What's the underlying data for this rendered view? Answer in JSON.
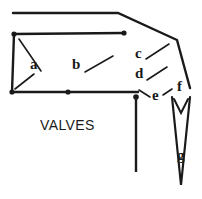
{
  "figure": {
    "width": 202,
    "height": 199,
    "background": "#ffffff",
    "stroke_color": "#1a1a1a",
    "text_color": "#1a1a1a",
    "caption": {
      "text": "VALVES",
      "x": 40,
      "y": 118
    },
    "labels": [
      {
        "id": "a",
        "text": "a",
        "x": 30,
        "y": 58
      },
      {
        "id": "b",
        "text": "b",
        "x": 72,
        "y": 58
      },
      {
        "id": "c",
        "text": "c",
        "x": 134,
        "y": 47
      },
      {
        "id": "d",
        "text": "d",
        "x": 134,
        "y": 67
      },
      {
        "id": "e",
        "text": "e",
        "x": 151,
        "y": 97
      },
      {
        "id": "f",
        "text": "f",
        "x": 176,
        "y": 87
      },
      {
        "id": "g",
        "text": "g",
        "x": 177,
        "y": 154
      }
    ],
    "outline_points": [
      {
        "name": "top-rail-left",
        "x": 13,
        "y": 13
      },
      {
        "name": "top-rail-bend",
        "x": 118,
        "y": 13
      },
      {
        "name": "upper-right-bend",
        "x": 177,
        "y": 40
      },
      {
        "name": "right-lower",
        "x": 190,
        "y": 88
      }
    ],
    "second_rail": [
      {
        "name": "second-rail-left",
        "x": 14,
        "y": 34
      },
      {
        "name": "second-rail-right",
        "x": 124,
        "y": 33
      }
    ],
    "left_edge": [
      {
        "name": "second-rail-left",
        "x": 14,
        "y": 34
      },
      {
        "name": "bottom-rail-left",
        "x": 12,
        "y": 92
      }
    ],
    "bottom_rail": [
      {
        "name": "bottom-rail-left",
        "x": 12,
        "y": 92
      },
      {
        "name": "bottom-rail-mid",
        "x": 68,
        "y": 92
      },
      {
        "name": "bottom-rail-right",
        "x": 138,
        "y": 92
      }
    ],
    "stem": [
      {
        "name": "stem-top",
        "x": 136,
        "y": 97
      },
      {
        "name": "stem-bottom",
        "x": 136,
        "y": 172
      }
    ],
    "span_g": [
      {
        "name": "span-left-top",
        "x": 172,
        "y": 97
      },
      {
        "name": "span-right-top",
        "x": 190,
        "y": 97
      },
      {
        "name": "span-apex",
        "x": 181,
        "y": 185
      }
    ],
    "vertex_dots": [
      {
        "name": "dot-second-rail-left",
        "x": 14,
        "y": 34
      },
      {
        "name": "dot-second-rail-right",
        "x": 124,
        "y": 33
      },
      {
        "name": "dot-bottom-rail-left",
        "x": 12,
        "y": 92
      },
      {
        "name": "dot-bottom-rail-mid",
        "x": 68,
        "y": 92
      },
      {
        "name": "dot-stem-top",
        "x": 136,
        "y": 97
      }
    ],
    "leaders": [
      {
        "name": "leader-a-upper",
        "from": [
          40,
          72
        ],
        "to": [
          20,
          40
        ]
      },
      {
        "name": "leader-a-lower",
        "from": [
          34,
          74
        ],
        "to": [
          16,
          90
        ]
      },
      {
        "name": "leader-b",
        "from": [
          86,
          70
        ],
        "to": [
          112,
          56
        ]
      },
      {
        "name": "leader-c",
        "from": [
          147,
          58
        ],
        "to": [
          168,
          45
        ]
      },
      {
        "name": "leader-d",
        "from": [
          148,
          78
        ],
        "to": [
          166,
          67
        ]
      },
      {
        "name": "leader-e",
        "from": [
          150,
          97
        ],
        "to": [
          139,
          89
        ]
      },
      {
        "name": "leader-e2",
        "from": [
          162,
          96
        ],
        "to": [
          172,
          90
        ]
      },
      {
        "name": "leader-f",
        "from": [
          181,
          101
        ],
        "to": [
          175,
          112
        ]
      },
      {
        "name": "leader-f2",
        "from": [
          184,
          101
        ],
        "to": [
          190,
          112
        ]
      }
    ]
  }
}
